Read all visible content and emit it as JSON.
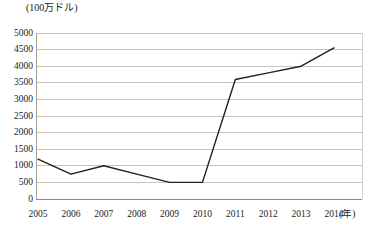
{
  "chart_data": {
    "type": "line",
    "title": "",
    "subtitle": "",
    "xlabel": "(年)",
    "ylabel": "(100万ドル)",
    "categories": [
      "2005",
      "2006",
      "2007",
      "2008",
      "2009",
      "2010",
      "2011",
      "2012",
      "2013",
      "2014"
    ],
    "values": [
      1200,
      750,
      1000,
      750,
      500,
      500,
      3600,
      3800,
      4000,
      4550
    ],
    "series": [
      {
        "name": "",
        "values": [
          1200,
          750,
          1000,
          750,
          500,
          500,
          3600,
          3800,
          4000,
          4550
        ]
      }
    ],
    "ylim": [
      0,
      5000
    ],
    "ytick_values": [
      0,
      500,
      1000,
      1500,
      2000,
      2500,
      3000,
      3500,
      4000,
      4500,
      5000
    ],
    "ytick_labels": [
      "0",
      "500",
      "1000",
      "1500",
      "2000",
      "2500",
      "3000",
      "3500",
      "4000",
      "4500",
      "5000"
    ],
    "xtick_labels": [
      "2005",
      "2006",
      "2007",
      "2008",
      "2009",
      "2010",
      "2011",
      "2012",
      "2013",
      "2014"
    ],
    "grid": true,
    "grid_axis": "y",
    "legend": false,
    "legend_position": "none",
    "line_color": "#231f20",
    "grid_color": "#b9b6ad",
    "axis_color": "#8a877e",
    "marker": "none"
  }
}
